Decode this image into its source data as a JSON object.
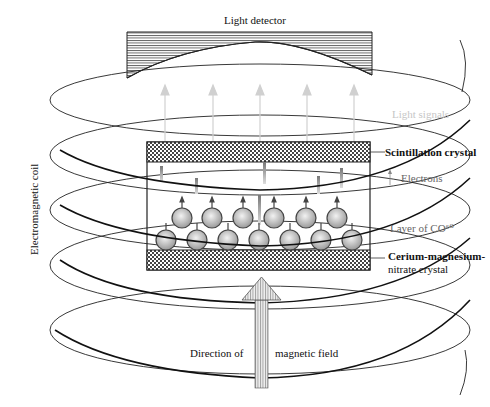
{
  "diagram": {
    "labels": {
      "light_detector": "Light detector",
      "light_signals": "Light signals",
      "scintillation_crystal": "Scintillation crystal",
      "electrons": "Electrons",
      "layer_co60": "Layer of CO⁶⁰",
      "cerium_line1": "Cerium-magnesium-",
      "cerium_line2": "nitrate crystal",
      "electromagnetic_coil": "Electromagnetic coil",
      "direction_of": "Direction of",
      "magnetic_field": "magnetic field"
    },
    "colors": {
      "line": "#222222",
      "light_arrow": "#d0d0d0",
      "atom_fill": "#cfcfcf",
      "hatch": "#333333"
    }
  }
}
